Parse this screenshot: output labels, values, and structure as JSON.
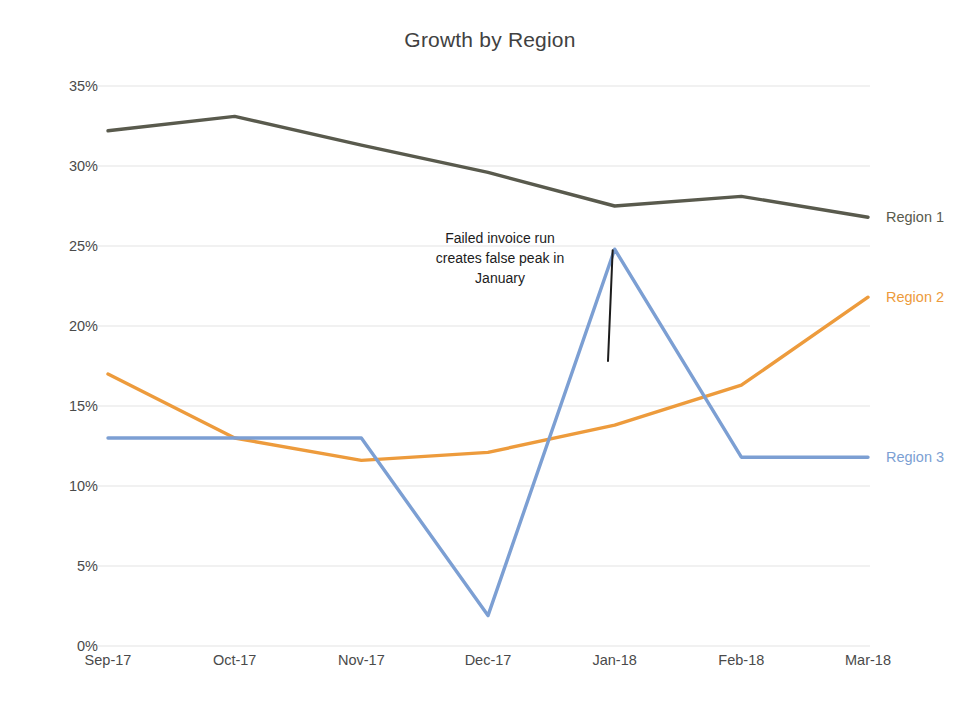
{
  "chart_data": {
    "type": "line",
    "title": "Growth by Region",
    "xlabel": "",
    "ylabel": "",
    "categories": [
      "Sep-17",
      "Oct-17",
      "Nov-17",
      "Dec-17",
      "Jan-18",
      "Feb-18",
      "Mar-18"
    ],
    "ylim": [
      0,
      35
    ],
    "ytick_values": [
      0,
      5,
      10,
      15,
      20,
      25,
      30,
      35
    ],
    "ytick_labels": [
      "0%",
      "5%",
      "10%",
      "15%",
      "20%",
      "25%",
      "30%",
      "35%"
    ],
    "grid": true,
    "legend_position": "end-of-line-labels",
    "series": [
      {
        "name": "Region 1",
        "color": "#595a4d",
        "values": [
          32.2,
          33.1,
          31.3,
          29.6,
          27.5,
          28.1,
          26.8
        ]
      },
      {
        "name": "Region 2",
        "color": "#ed9b3c",
        "values": [
          17.0,
          13.0,
          11.6,
          12.1,
          13.8,
          16.3,
          21.8
        ]
      },
      {
        "name": "Region 3",
        "color": "#7c9fd3",
        "values": [
          13.0,
          13.0,
          13.0,
          1.9,
          24.8,
          11.8,
          11.8
        ]
      }
    ],
    "annotations": [
      {
        "id": "false-peak-callout",
        "lines": [
          "Failed invoice run",
          "creates false peak in",
          "January"
        ],
        "text": "Failed invoice run creates false peak in January",
        "points_to_series": "Region 3",
        "points_to_category": "Jan-18",
        "points_to_value": 24.8,
        "color": "#1c1c1c"
      }
    ]
  },
  "style": {
    "background": "#ffffff",
    "gridline_color": "#e3e3e3",
    "tick_text_color": "#4a4a4a",
    "title_color": "#414141",
    "line_width": 3.4
  }
}
